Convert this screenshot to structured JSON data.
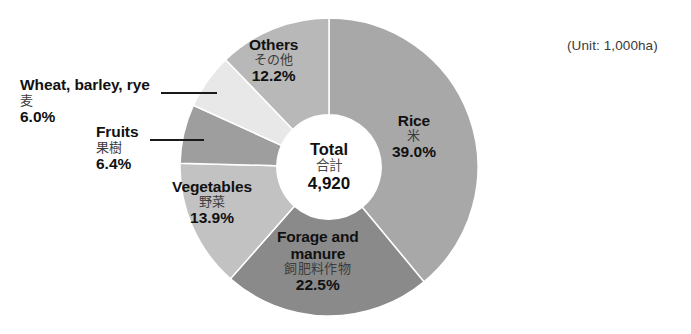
{
  "figure": {
    "unit_note": "(Unit: 1,000ha)",
    "center": {
      "label_en": "Total",
      "label_jp": "合計",
      "value": "4,920"
    }
  },
  "chart_data": {
    "type": "pie",
    "variant": "donut",
    "title": "",
    "unit": "1,000ha",
    "total": 4920,
    "total_label_en": "Total",
    "total_label_jp": "合計",
    "start_angle_deg": 0,
    "direction": "clockwise",
    "inner_radius_ratio": 0.35,
    "legend": "none",
    "grid": false,
    "categories": [
      "Rice",
      "Forage and manure",
      "Vegetables",
      "Fruits",
      "Wheat, barley, rye",
      "Others"
    ],
    "values": [
      39.0,
      22.5,
      13.9,
      6.4,
      6.0,
      12.2
    ],
    "slices": [
      {
        "key": "rice",
        "label_en": "Rice",
        "label_jp": "米",
        "percent": 39.0,
        "percent_text": "39.0%",
        "color": "#a8a8a8",
        "label_placement": "inside"
      },
      {
        "key": "forage",
        "label_en": "Forage and manure",
        "label_en_line1": "Forage and",
        "label_en_line2": "manure",
        "label_jp": "飼肥料作物",
        "percent": 22.5,
        "percent_text": "22.5%",
        "color": "#8a8a8a",
        "label_placement": "inside"
      },
      {
        "key": "vegetables",
        "label_en": "Vegetables",
        "label_jp": "野菜",
        "percent": 13.9,
        "percent_text": "13.9%",
        "color": "#c2c2c2",
        "label_placement": "inside"
      },
      {
        "key": "fruits",
        "label_en": "Fruits",
        "label_jp": "果樹",
        "percent": 6.4,
        "percent_text": "6.4%",
        "color": "#9e9e9e",
        "label_placement": "outside"
      },
      {
        "key": "wheat",
        "label_en": "Wheat, barley, rye",
        "label_jp": "麦",
        "percent": 6.0,
        "percent_text": "6.0%",
        "color": "#e8e8e8",
        "label_placement": "outside"
      },
      {
        "key": "others",
        "label_en": "Others",
        "label_jp": "その他",
        "percent": 12.2,
        "percent_text": "12.2%",
        "color": "#b8b8b8",
        "label_placement": "inside"
      }
    ]
  }
}
